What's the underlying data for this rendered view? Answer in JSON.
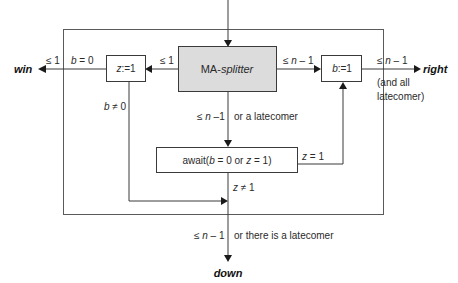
{
  "diagram": {
    "splitter": {
      "prefix": "MA-",
      "name": "splitter"
    },
    "z_box": {
      "var": "z",
      "assign": ":=1"
    },
    "b_box": {
      "var": "b",
      "assign": ":=1"
    },
    "await_box": {
      "pre": "await(",
      "b": "b",
      "mid1": " = 0 or ",
      "z": "z",
      "mid2": " = 1)"
    },
    "outputs": {
      "win": "win",
      "right": "right",
      "down": "down"
    },
    "labels": {
      "left_le1_outer": "≤ 1",
      "left_b0_pre": "b",
      "left_b0_post": " = 0",
      "splitter_left_le1": "≤ 1",
      "splitter_right_pre": "≤ ",
      "splitter_right_n": "n",
      "splitter_right_post": " – 1",
      "right_out_pre": "≤ ",
      "right_out_n": "n",
      "right_out_post": " – 1",
      "right_note_1": "(and all",
      "right_note_2": "latecomer)",
      "b_ne0_pre": "b",
      "b_ne0_post": " ≠ 0",
      "center_pre": "≤ ",
      "center_n": "n",
      "center_post": " –1",
      "center_note": "or a latecomer",
      "z_eq1_pre": "z",
      "z_eq1_post": " = 1",
      "z_ne1_pre": "z",
      "z_ne1_post": " ≠ 1",
      "bottom_pre": "≤ ",
      "bottom_n": "n",
      "bottom_post": " – 1",
      "bottom_note": "or there is a latecomer"
    }
  }
}
